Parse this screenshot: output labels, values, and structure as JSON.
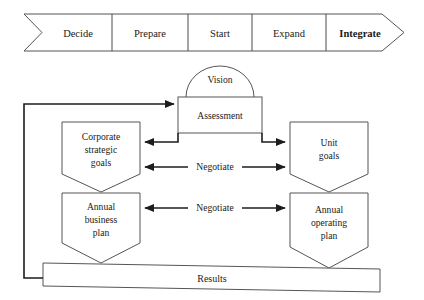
{
  "diagram": {
    "colors": {
      "background": "#ffffff",
      "shape_stroke": "#555555",
      "connector_stroke": "#1c1c1c",
      "text": "#1a1a1a"
    },
    "phase_banner": {
      "name": "phase-chevron-banner",
      "steps": [
        {
          "label": "Decide",
          "emphasis": "normal"
        },
        {
          "label": "Prepare",
          "emphasis": "normal"
        },
        {
          "label": "Start",
          "emphasis": "normal"
        },
        {
          "label": "Expand",
          "emphasis": "normal"
        },
        {
          "label": "Integrate",
          "emphasis": "bold"
        }
      ]
    },
    "nodes": {
      "vision": {
        "label": "Vision",
        "shape": "semicircle-arc"
      },
      "assessment": {
        "label": "Assessment",
        "shape": "rectangle"
      },
      "corporate_strategic_goals": {
        "label_line1": "Corporate",
        "label_line2": "strategic",
        "label_line3": "goals",
        "shape": "pentagon-down"
      },
      "unit_goals": {
        "label_line1": "Unit",
        "label_line2": "goals",
        "shape": "pentagon-down"
      },
      "annual_business_plan": {
        "label_line1": "Annual",
        "label_line2": "business",
        "label_line3": "plan",
        "shape": "pentagon-down"
      },
      "annual_operating_plan": {
        "label_line1": "Annual",
        "label_line2": "operating",
        "label_line3": "plan",
        "shape": "pentagon-down"
      },
      "results": {
        "label": "Results",
        "shape": "slanted-banner"
      }
    },
    "edges": {
      "negotiate_upper": {
        "label": "Negotiate",
        "direction": "bidirectional"
      },
      "negotiate_lower": {
        "label": "Negotiate",
        "direction": "bidirectional"
      },
      "assessment_to_corporate": {
        "label": "",
        "direction": "left"
      },
      "assessment_to_unit": {
        "label": "",
        "direction": "right"
      },
      "results_feedback_to_assessment": {
        "label": "",
        "direction": "right"
      }
    }
  }
}
